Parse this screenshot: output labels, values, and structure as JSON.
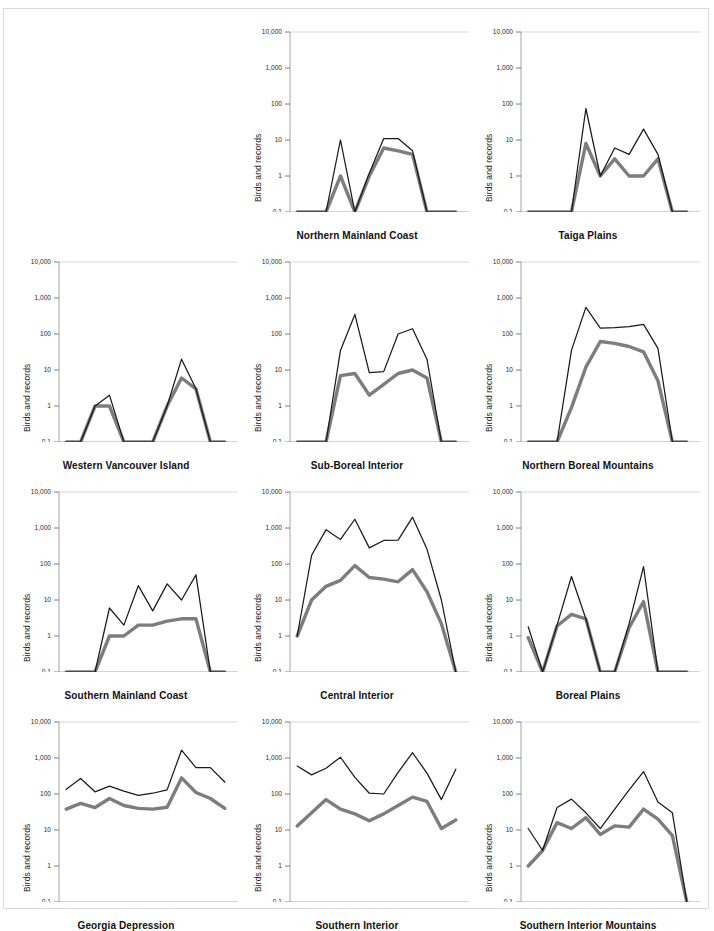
{
  "figure": {
    "ylabel": "Birds and records",
    "y_ticks": [
      "10,000",
      "1,000",
      "100",
      "10",
      "1",
      "0.1"
    ],
    "x_ticks": [
      "J",
      "F",
      "M",
      "A",
      "M",
      "J",
      "J",
      "A",
      "S",
      "O",
      "N",
      "D"
    ],
    "colors": {
      "records_line": "#1a1a1a",
      "birds_line": "#7d7d7d",
      "axis": "#9a9a9a",
      "grid": "#cfcfcf",
      "frame": "#d8d8d8"
    }
  },
  "chart_data": {
    "type": "line",
    "title": "",
    "xlabel": "",
    "ylabel": "Birds and records",
    "x": [
      "J",
      "F",
      "M",
      "A",
      "M",
      "J",
      "J",
      "A",
      "S",
      "O",
      "N",
      "D"
    ],
    "yscale": "log",
    "ylim": [
      0.1,
      10000
    ],
    "grid": false,
    "legend": "none",
    "series_names": [
      "records",
      "birds"
    ],
    "panels": [
      {
        "name": "Northern Mainland Coast",
        "series": [
          {
            "name": "records",
            "values": [
              0.1,
              0.1,
              0.1,
              10,
              0.1,
              1.2,
              11,
              11,
              5,
              0.1,
              0.1,
              0.1
            ]
          },
          {
            "name": "birds",
            "values": [
              0.1,
              0.1,
              0.1,
              1,
              0.1,
              1.0,
              6,
              5,
              4,
              0.1,
              0.1,
              0.1
            ]
          }
        ]
      },
      {
        "name": "Taiga Plains",
        "series": [
          {
            "name": "records",
            "values": [
              0.1,
              0.1,
              0.1,
              0.1,
              75,
              1.0,
              6,
              4,
              20,
              4,
              0.1,
              0.1
            ]
          },
          {
            "name": "birds",
            "values": [
              0.1,
              0.1,
              0.1,
              0.1,
              8,
              1.0,
              3,
              1.0,
              1.0,
              3,
              0.1,
              0.1
            ]
          }
        ]
      },
      {
        "name": "Western Vancouver Island",
        "series": [
          {
            "name": "records",
            "values": [
              0.1,
              0.1,
              1.0,
              2.0,
              0.1,
              0.1,
              0.1,
              1.0,
              20,
              3,
              0.1,
              0.1
            ]
          },
          {
            "name": "birds",
            "values": [
              0.1,
              0.1,
              1.0,
              1.0,
              0.1,
              0.1,
              0.1,
              1.0,
              6,
              3,
              0.1,
              0.1
            ]
          }
        ]
      },
      {
        "name": "Sub-Boreal Interior",
        "series": [
          {
            "name": "records",
            "values": [
              0.1,
              0.1,
              0.1,
              35,
              350,
              8.5,
              9,
              100,
              140,
              20,
              0.1,
              0.1
            ]
          },
          {
            "name": "birds",
            "values": [
              0.1,
              0.1,
              0.1,
              7,
              8,
              2.0,
              4,
              8,
              10,
              6,
              0.1,
              0.1
            ]
          }
        ]
      },
      {
        "name": "Northern Boreal Mountains",
        "series": [
          {
            "name": "records",
            "values": [
              0.1,
              0.1,
              0.1,
              35,
              550,
              145,
              150,
              160,
              185,
              40,
              0.1,
              0.1
            ]
          },
          {
            "name": "birds",
            "values": [
              0.1,
              0.1,
              0.1,
              0.9,
              12,
              62,
              55,
              45,
              32,
              5,
              0.1,
              0.1
            ]
          }
        ]
      },
      {
        "name": "Southern Mainland Coast",
        "series": [
          {
            "name": "records",
            "values": [
              0.1,
              0.1,
              0.1,
              6,
              2.0,
              25,
              5,
              28,
              10,
              50,
              0.1,
              0.1
            ]
          },
          {
            "name": "birds",
            "values": [
              0.1,
              0.1,
              0.1,
              1.0,
              1.0,
              2.0,
              2.0,
              2.6,
              3.0,
              3.0,
              0.1,
              0.1
            ]
          }
        ]
      },
      {
        "name": "Central Interior",
        "series": [
          {
            "name": "records",
            "values": [
              1.0,
              175,
              900,
              480,
              1750,
              280,
              450,
              460,
              2000,
              260,
              10,
              0.1
            ]
          },
          {
            "name": "birds",
            "values": [
              1.0,
              10,
              24,
              35,
              90,
              42,
              38,
              32,
              70,
              17,
              2.2,
              0.1
            ]
          }
        ]
      },
      {
        "name": "Boreal Plains",
        "series": [
          {
            "name": "records",
            "values": [
              1.8,
              0.1,
              2.0,
              45,
              3.0,
              0.1,
              0.1,
              2.2,
              85,
              0.1,
              0.1,
              0.1
            ]
          },
          {
            "name": "birds",
            "values": [
              0.9,
              0.1,
              1.9,
              4.0,
              3.0,
              0.1,
              0.1,
              1.7,
              9,
              0.1,
              0.1,
              0.1
            ]
          }
        ]
      },
      {
        "name": "Georgia Depression",
        "series": [
          {
            "name": "records",
            "values": [
              135,
              270,
              115,
              165,
              120,
              92,
              105,
              130,
              1650,
              540,
              540,
              215
            ]
          },
          {
            "name": "birds",
            "values": [
              38,
              55,
              42,
              75,
              48,
              40,
              38,
              43,
              280,
              110,
              75,
              40
            ]
          }
        ]
      },
      {
        "name": "Southern Interior",
        "series": [
          {
            "name": "records",
            "values": [
              600,
              340,
              520,
              1050,
              290,
              105,
              100,
              400,
              1400,
              380,
              70,
              490
            ]
          },
          {
            "name": "birds",
            "values": [
              13,
              30,
              70,
              38,
              28,
              18,
              28,
              48,
              82,
              62,
              11,
              19
            ]
          }
        ]
      },
      {
        "name": "Southern Interior Mountains",
        "series": [
          {
            "name": "records",
            "values": [
              11,
              2.7,
              42,
              72,
              30,
              11,
              38,
              130,
              420,
              60,
              30,
              0.1
            ]
          },
          {
            "name": "birds",
            "values": [
              1.0,
              2.7,
              16,
              11,
              22,
              7.5,
              13,
              12,
              38,
              20,
              7,
              0.1
            ]
          }
        ]
      }
    ]
  }
}
